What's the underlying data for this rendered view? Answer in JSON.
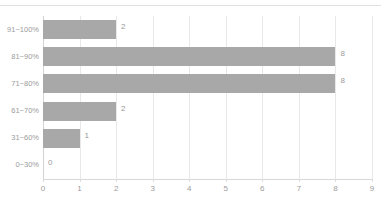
{
  "chart_data": {
    "type": "bar",
    "orientation": "horizontal",
    "title": "",
    "xlabel": "",
    "ylabel": "",
    "categories": [
      "0~30%",
      "31~60%",
      "61~70%",
      "71~80%",
      "81~90%",
      "91~100%"
    ],
    "values": [
      0,
      1,
      2,
      8,
      8,
      2
    ],
    "value_labels": [
      "0",
      "1",
      "2",
      "8",
      "8",
      "2"
    ],
    "xlim": [
      0,
      9
    ],
    "xticks": [
      0,
      1,
      2,
      3,
      4,
      5,
      6,
      7,
      8,
      9
    ],
    "xtick_labels": [
      "0",
      "1",
      "2",
      "3",
      "4",
      "5",
      "6",
      "7",
      "8",
      "9"
    ],
    "grid": true,
    "grid_axis": "x",
    "legend": false,
    "bar_color": "#a8a8a8",
    "gridline_color": "#e8e8e8",
    "text_color": "#9b9b9b",
    "background_color": "#ffffff"
  }
}
